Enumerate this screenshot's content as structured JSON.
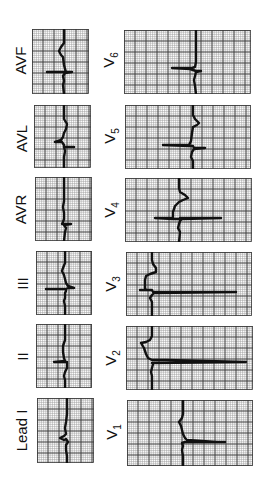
{
  "figure": {
    "grid": {
      "minor_color": "#9a9a9a",
      "major_color": "#3a3a3a",
      "minor_step": 2.2,
      "major_step": 11
    },
    "trace_color": "#111111"
  },
  "limb_leads": [
    {
      "label": "AVF",
      "x": 32,
      "y": 29,
      "w": 57,
      "h": 65,
      "lx": 20,
      "ly": 60,
      "path": "M32 0 L32 14 L29 18 L27 22 L29 26 L31 28 L32 36 L33 40 L34 43 L15 43 L33 43 L40 43 L33 44 L31 47 L32 52 L31 56 L32 65"
    },
    {
      "label": "AVL",
      "x": 34,
      "y": 105,
      "w": 57,
      "h": 63,
      "lx": 21,
      "ly": 138,
      "path": "M30 0 L30 14 L33 19 L32 24 L30 28 L29 32 L27 35 L21 37 L28 37 L30 40 L30 42 L40 42 L30 42 L31 46 L30 52 L30 63"
    },
    {
      "label": "AVR",
      "x": 35,
      "y": 177,
      "w": 57,
      "h": 64,
      "lx": 21,
      "ly": 209,
      "path": "M29 0 L29 24 L28 30 L29 36 L29 42 L28 45 L27 47 L36 47 L29 48 L31 51 L30 55 L29 64"
    },
    {
      "label": "III",
      "x": 36,
      "y": 251,
      "w": 56,
      "h": 64,
      "lx": 22,
      "ly": 283,
      "path": "M29 0 L29 12 L27 17 L26 20 L28 24 L29 28 L30 32 L32 35 L38 37 L32 37 L30 38 L10 38 L30 38 L30 40 L29 42 L29 47 L28 50 L29 55 L29 64"
    },
    {
      "label": "II",
      "x": 36,
      "y": 324,
      "w": 56,
      "h": 64,
      "lx": 22,
      "ly": 356,
      "path": "M29 0 L29 16 L27 22 L27 28 L28 34 L29 37 L18 38 L30 38 L31 38 L31 44 L29 48 L28 52 L29 56 L29 64"
    },
    {
      "label": "Lead I",
      "x": 37,
      "y": 398,
      "w": 57,
      "h": 65,
      "lx": 22,
      "ly": 430,
      "path": "M30 0 L30 16 L29 24 L28 30 L29 36 L27 38 L23 40 L27 42 L29 41 L31 44 L29 47 L29 52 L30 58 L30 65"
    }
  ],
  "chest_leads": [
    {
      "label": "V",
      "sub": "6",
      "x": 124,
      "y": 30,
      "w": 127,
      "h": 64,
      "lx": 110,
      "ly": 60,
      "path": "M72 0 L72 32 L71 37 L68 38 L48 38 L66 39 L69 40 L72 41 L77 41 L72 42 L71 46 L70 50 L71 56 L72 64"
    },
    {
      "label": "V",
      "sub": "5",
      "x": 125,
      "y": 105,
      "w": 126,
      "h": 64,
      "lx": 111,
      "ly": 136,
      "path": "M68 0 L68 10 L70 14 L74 18 L72 20 L68 22 L67 28 L66 36 L64 40 L38 40 L64 41 L68 41 L69 43 L80 43 L69 44 L67 47 L66 52 L68 56 L68 64"
    },
    {
      "label": "V",
      "sub": "4",
      "x": 125,
      "y": 178,
      "w": 127,
      "h": 64,
      "lx": 111,
      "ly": 210,
      "path": "M54 0 L54 10 L55 14 L60 17 L63 20 L58 22 L54 24 L50 28 L48 34 L48 40 L30 40 L48 41 L54 41 L55 42 L55 40 L96 40 L57 41 L55 43 L54 46 L53 50 L55 54 L54 64"
    },
    {
      "label": "V",
      "sub": "3",
      "x": 126,
      "y": 252,
      "w": 126,
      "h": 64,
      "lx": 112,
      "ly": 284,
      "path": "M26 0 L26 8 L27 12 L30 16 L30 20 L24 22 L20 24 L19 28 L19 36 L20 38 L14 38 L26 38 L27 40 L110 40 L28 41 L26 43 L24 46 L26 50 L26 64"
    },
    {
      "label": "V",
      "sub": "2",
      "x": 126,
      "y": 326,
      "w": 127,
      "h": 64,
      "lx": 112,
      "ly": 358,
      "path": "M26 0 L26 10 L24 14 L20 16 L15 17 L18 22 L20 28 L22 32 L26 34 L40 34 L120 36 L26 37 L27 38 L26 42 L25 46 L26 50 L26 64"
    },
    {
      "label": "V",
      "sub": "1",
      "x": 127,
      "y": 400,
      "w": 126,
      "h": 66,
      "lx": 113,
      "ly": 432,
      "path": "M56 0 L56 14 L55 18 L52 22 L54 26 L55 30 L56 34 L58 38 L60 40 L90 42 L98 42 L58 42 L55 43 L56 46 L55 50 L56 56 L56 66"
    }
  ]
}
